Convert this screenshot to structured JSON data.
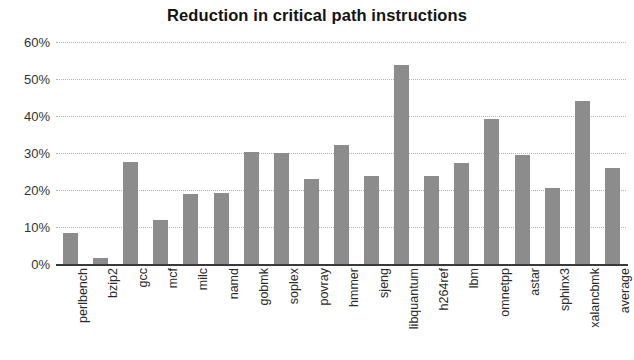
{
  "chart_data": {
    "type": "bar",
    "title": "Reduction in critical path instructions",
    "xlabel": "",
    "ylabel": "",
    "ylim": [
      0,
      60
    ],
    "ytick_labels": [
      "60%",
      "50%",
      "40%",
      "30%",
      "20%",
      "10%",
      "0%"
    ],
    "ytick_values": [
      60,
      50,
      40,
      30,
      20,
      10,
      0
    ],
    "grid": true,
    "legend": false,
    "bar_color": "#8c8c8c",
    "categories": [
      "perlbench",
      "bzip2",
      "gcc",
      "mcf",
      "milc",
      "namd",
      "gobmk",
      "soplex",
      "povray",
      "hmmer",
      "sjeng",
      "libquantum",
      "h264ref",
      "lbm",
      "omnetpp",
      "astar",
      "sphinx3",
      "xalancbmk",
      "average"
    ],
    "values": [
      8.4,
      1.5,
      27.5,
      12.0,
      19.0,
      19.1,
      30.2,
      30.0,
      22.9,
      32.1,
      23.8,
      53.8,
      23.8,
      27.4,
      39.3,
      29.4,
      20.6,
      44.0,
      26.0
    ]
  }
}
